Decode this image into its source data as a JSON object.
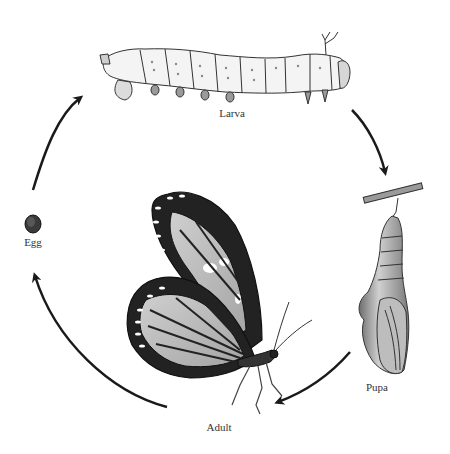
{
  "diagram": {
    "type": "life-cycle",
    "stages": [
      {
        "id": "larva",
        "label": "Larva",
        "label_pos": [
          232,
          114
        ]
      },
      {
        "id": "pupa",
        "label": "Pupa",
        "label_pos": [
          377,
          387
        ]
      },
      {
        "id": "adult",
        "label": "Adult",
        "label_pos": [
          219,
          428
        ]
      },
      {
        "id": "egg",
        "label": "Egg",
        "label_pos": [
          33,
          240
        ]
      }
    ],
    "arrows": [
      {
        "from": "egg",
        "to": "larva"
      },
      {
        "from": "larva",
        "to": "pupa"
      },
      {
        "from": "pupa",
        "to": "adult"
      },
      {
        "from": "adult",
        "to": "egg"
      }
    ],
    "colors": {
      "ink": "#1a1a1a",
      "label": "#333333",
      "background": "#ffffff",
      "shade": "#9a9a9a",
      "light": "#d8d8d8"
    }
  }
}
